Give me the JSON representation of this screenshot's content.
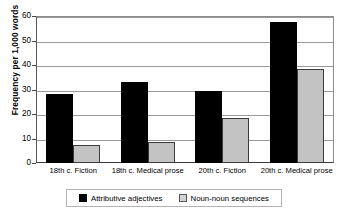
{
  "chart_data": {
    "type": "bar",
    "title": "",
    "subtitle": "",
    "xlabel": "",
    "ylabel": "Frequency per 1,000 words",
    "ylim": [
      0,
      60
    ],
    "yticks": [
      0,
      10,
      20,
      30,
      40,
      50,
      60
    ],
    "ytick_labels": [
      "0",
      "10",
      "20",
      "30",
      "40",
      "50",
      "60"
    ],
    "grid": true,
    "legend_position": "bottom",
    "categories": [
      "18th c. Fiction",
      "18th c. Medical prose",
      "20th c. Fiction",
      "20th c. Medical prose"
    ],
    "series": [
      {
        "name": "Attributive adjectives",
        "color": "#000000",
        "values": [
          28.0,
          33.2,
          29.3,
          57.5
        ]
      },
      {
        "name": "Noun-noun sequences",
        "color": "#c3c3c3",
        "values": [
          7.5,
          8.7,
          18.4,
          38.3
        ]
      }
    ]
  }
}
